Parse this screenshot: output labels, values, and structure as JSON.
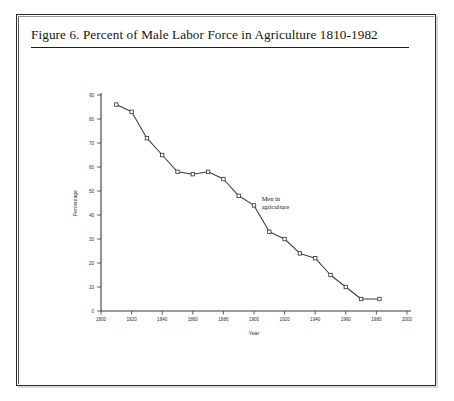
{
  "figure": {
    "caption": "Figure 6. Percent of Male Labor Force in Agriculture 1810-1982"
  },
  "chart_data": {
    "type": "line",
    "title": "Percent of Male Labor Force in Agriculture 1810-1982",
    "xlabel": "Year",
    "ylabel": "Percentage",
    "xlim": [
      1800,
      2000
    ],
    "ylim": [
      0,
      90
    ],
    "xticks": [
      1800,
      1820,
      1840,
      1860,
      1880,
      1900,
      1920,
      1940,
      1960,
      1980,
      2000
    ],
    "yticks": [
      0,
      10,
      20,
      30,
      40,
      50,
      60,
      70,
      80,
      90
    ],
    "grid": false,
    "legend": "none",
    "markers": "open-square",
    "annotations": [
      {
        "text_line1": "Men in",
        "text_line2": "agriculture",
        "x": 1905,
        "y": 46
      }
    ],
    "series": [
      {
        "name": "Men in agriculture",
        "x": [
          1810,
          1820,
          1830,
          1840,
          1850,
          1860,
          1870,
          1880,
          1890,
          1900,
          1910,
          1920,
          1930,
          1940,
          1950,
          1960,
          1970,
          1982
        ],
        "values": [
          86,
          83,
          72,
          65,
          58,
          57,
          58,
          55,
          48,
          44,
          33,
          30,
          24,
          22,
          15,
          10,
          5,
          5
        ]
      }
    ]
  },
  "axis_labels": {
    "x_tick_texts": [
      "1800",
      "1820",
      "1840",
      "1860",
      "1880",
      "1900",
      "1920",
      "1940",
      "1960",
      "1980",
      "2000"
    ],
    "y_tick_texts": [
      "0",
      "10",
      "20",
      "30",
      "40",
      "50",
      "60",
      "70",
      "80",
      "90"
    ]
  }
}
